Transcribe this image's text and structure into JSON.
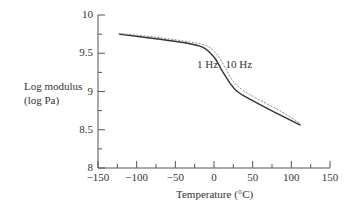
{
  "chart_data": {
    "type": "line",
    "title": "",
    "xlabel": "Temperature (°C)",
    "ylabel": "Log modulus\n(log Pa)",
    "ylabel_line1": "Log modulus",
    "ylabel_line2": "(log Pa)",
    "xlim": [
      -150,
      150
    ],
    "ylim": [
      8,
      10
    ],
    "x_ticks": [
      -150,
      -100,
      -50,
      0,
      50,
      100,
      150
    ],
    "x_tick_labels": [
      "−150",
      "−100",
      "−50",
      "0",
      "50",
      "100",
      "150"
    ],
    "y_ticks": [
      8,
      8.5,
      9,
      9.5,
      10
    ],
    "y_tick_labels": [
      "8",
      "8.5",
      "9",
      "9.5",
      "10"
    ],
    "grid": false,
    "legend": "inline labels",
    "series": [
      {
        "name": "1 Hz",
        "style": "solid",
        "x": [
          -123,
          -75,
          -40,
          -15,
          0,
          10,
          20,
          30,
          50,
          80,
          112
        ],
        "y": [
          9.75,
          9.69,
          9.64,
          9.58,
          9.45,
          9.28,
          9.12,
          9.0,
          8.88,
          8.72,
          8.56
        ]
      },
      {
        "name": "10 Hz",
        "style": "dashed",
        "x": [
          -123,
          -75,
          -40,
          -10,
          5,
          15,
          25,
          37,
          55,
          85,
          112
        ],
        "y": [
          9.76,
          9.71,
          9.66,
          9.6,
          9.47,
          9.3,
          9.13,
          9.02,
          8.91,
          8.75,
          8.58
        ]
      }
    ],
    "annotations": [
      {
        "text": "1 Hz",
        "x": -22,
        "y": 9.35
      },
      {
        "text": "10 Hz",
        "x": 15,
        "y": 9.35
      }
    ]
  }
}
